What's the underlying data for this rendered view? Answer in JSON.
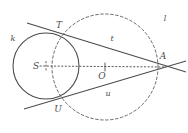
{
  "figure": {
    "type": "geometry-diagram",
    "canvas": {
      "width": 188,
      "height": 133
    },
    "colors": {
      "stroke": "#4a4a4a",
      "dashed_stroke": "#5a5a5a",
      "background": "#ffffff",
      "label": "#4a4a4a"
    },
    "shapes": {
      "circle_k": {
        "name": "solid-circle-k",
        "cx": 46,
        "cy": 66,
        "r": 33,
        "style": "solid"
      },
      "circle_l": {
        "name": "dashed-circle-l",
        "cx": 105,
        "cy": 67,
        "r": 53,
        "style": "dashed"
      },
      "line_t": {
        "name": "tangent-line-t",
        "x1": 27,
        "y1": 23,
        "x2": 186,
        "y2": 72
      },
      "line_u": {
        "name": "tangent-line-u",
        "x1": 24,
        "y1": 109,
        "x2": 186,
        "y2": 61
      },
      "segment_SA": {
        "name": "center-line-s-a",
        "x1": 46,
        "y1": 66,
        "x2": 166,
        "y2": 67,
        "style": "dotted"
      }
    },
    "points": [
      {
        "id": "T",
        "label": "T",
        "x": 62,
        "y": 32
      },
      {
        "id": "U",
        "label": "U",
        "x": 61,
        "y": 100
      },
      {
        "id": "A",
        "label": "A",
        "x": 158,
        "y": 67
      },
      {
        "id": "S",
        "label": "S",
        "x": 46,
        "y": 66
      },
      {
        "id": "O",
        "label": "O",
        "x": 105,
        "y": 67
      }
    ],
    "labels": [
      {
        "name": "label-k",
        "text": "k",
        "x": 13,
        "y": 41,
        "kind": "curve"
      },
      {
        "name": "label-l",
        "text": "l",
        "x": 165,
        "y": 21,
        "kind": "curve"
      },
      {
        "name": "label-t",
        "text": "t",
        "x": 112,
        "y": 41,
        "kind": "curve"
      },
      {
        "name": "label-u",
        "text": "u",
        "x": 108,
        "y": 96,
        "kind": "curve"
      },
      {
        "name": "label-T",
        "text": "T",
        "x": 59,
        "y": 28,
        "kind": "point"
      },
      {
        "name": "label-U",
        "text": "U",
        "x": 58,
        "y": 112,
        "kind": "point"
      },
      {
        "name": "label-A",
        "text": "A",
        "x": 163,
        "y": 59,
        "kind": "point"
      },
      {
        "name": "label-S",
        "text": "S",
        "x": 36,
        "y": 69,
        "kind": "point"
      },
      {
        "name": "label-O",
        "text": "O",
        "x": 102,
        "y": 79,
        "kind": "point"
      }
    ]
  }
}
